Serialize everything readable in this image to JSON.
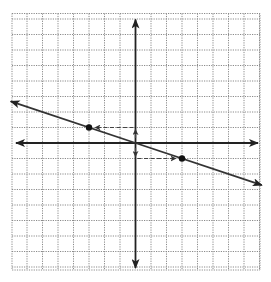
{
  "chart_data": {
    "type": "line",
    "title": "",
    "xlabel": "",
    "ylabel": "",
    "grid": true,
    "xlim": [
      -8,
      8
    ],
    "ylim": [
      -8.2,
      8.3
    ],
    "axes_at_origin": true,
    "series": [
      {
        "name": "line",
        "equation": "y = -1/3 x",
        "slope": -0.3333,
        "intercept": 0,
        "x": [
          -8,
          8
        ],
        "y": [
          2.667,
          -2.667
        ],
        "arrows_both_ends": true
      }
    ],
    "points": [
      {
        "x": -3,
        "y": 1,
        "marker": "filled-circle"
      },
      {
        "x": 3,
        "y": -1,
        "marker": "filled-circle"
      },
      {
        "x": 0,
        "y": 0,
        "marker": "none"
      }
    ],
    "annotations": [
      {
        "type": "dashed-arrow",
        "from": [
          0,
          0
        ],
        "to": [
          0,
          1
        ],
        "meaning": "rise +1"
      },
      {
        "type": "dashed-arrow",
        "from": [
          0,
          1
        ],
        "to": [
          -3,
          1
        ],
        "meaning": "run -3"
      },
      {
        "type": "dashed-arrow",
        "from": [
          0,
          0
        ],
        "to": [
          0,
          -1
        ],
        "meaning": "rise -1"
      },
      {
        "type": "dashed-arrow",
        "from": [
          0,
          -1
        ],
        "to": [
          3,
          -1
        ],
        "meaning": "run +3"
      }
    ]
  },
  "layout": {
    "origin_px": [
      135.5,
      143
    ],
    "unit_px": 15.5,
    "grid_left_px": 12,
    "grid_right_px": 260,
    "grid_top_px": 13.5,
    "grid_bottom_px": 270,
    "colors": {
      "grid": "#8a8a8a",
      "axis": "#222222",
      "line": "#333333",
      "point": "#111111",
      "dashed": "#444444"
    }
  }
}
